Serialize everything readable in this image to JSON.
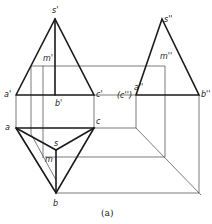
{
  "figure": {
    "caption": "(a)"
  },
  "front_view": {
    "labels": {
      "apex": "s'",
      "point_m": "m'",
      "a": "a'",
      "b": "b'",
      "c": "c'"
    }
  },
  "top_view": {
    "labels": {
      "a": "a",
      "c": "c",
      "apex": "s",
      "point_m": "m",
      "b": "b"
    }
  },
  "side_view": {
    "labels": {
      "apex": "s''",
      "point_m": "m''",
      "a": "a''",
      "c": "(c'')",
      "b": "b''"
    }
  },
  "colors": {
    "line": "#1a1a1a",
    "construction": "#444444",
    "background": "#ffffff"
  }
}
